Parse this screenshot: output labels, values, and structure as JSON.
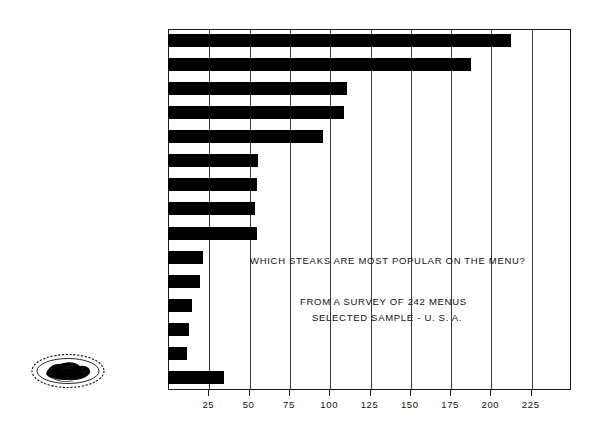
{
  "chart_data": {
    "type": "bar",
    "orientation": "horizontal",
    "title": "",
    "xlabel": "",
    "ylabel": "",
    "xlim": [
      0,
      250
    ],
    "grid": true,
    "legend": "none",
    "xticks": [
      25,
      50,
      75,
      100,
      125,
      150,
      175,
      200,
      225
    ],
    "categories": [
      "SIRLOIN",
      "FILET MIGNON",
      "CHOPPED STEAK",
      "NEW YORK STRIP",
      "T-BONE",
      "BUTT SIRLOIN - (CLUB)",
      "STEAK SANDWICH",
      "RIB-EYE",
      "TENDERLOIN",
      "PORTERHOUSE",
      "CHATEAUBRIAND",
      "STEAK KEBOBS",
      "DELMONICO",
      "KANSAS CITY",
      "OTHER"
    ],
    "values": [
      213,
      188,
      111,
      109,
      96,
      56,
      55,
      54,
      55,
      22,
      20,
      15,
      13,
      12,
      35
    ],
    "bar_color": "#000000",
    "annotations": [
      "WHICH STEAKS ARE MOST POPULAR ON THE MENU?",
      "FROM A SURVEY OF 242 MENUS",
      "SELECTED SAMPLE - U. S. A."
    ]
  },
  "annotations": {
    "question": "WHICH STEAKS ARE MOST POPULAR ON THE MENU?",
    "source_line1": "FROM A SURVEY OF 242 MENUS",
    "source_line2": "SELECTED SAMPLE - U. S. A."
  },
  "logo": {
    "name": "steak-platter-illustration"
  }
}
